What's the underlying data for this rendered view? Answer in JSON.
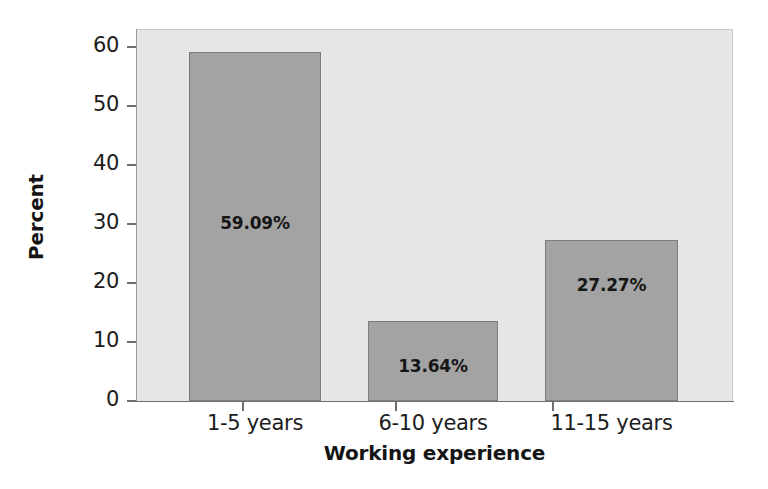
{
  "chart_data": {
    "type": "bar",
    "title": "",
    "xlabel": "Working experience",
    "ylabel": "Percent",
    "categories": [
      "1-5 years",
      "6-10 years",
      "11-15 years"
    ],
    "values": [
      59.09,
      13.64,
      27.27
    ],
    "data_labels": [
      "59.09%",
      "13.64%",
      "27.27%"
    ],
    "ylim": [
      0,
      62
    ],
    "yticks": [
      0,
      10,
      20,
      30,
      40,
      50,
      60
    ],
    "ytick_labels": [
      "0",
      "10",
      "20",
      "30",
      "40",
      "50",
      "60"
    ],
    "grid": false,
    "legend": false,
    "bar_color": "#a3a3a3",
    "bar_edge_color": "#7d7d7d",
    "plot_background": "#e9e9e9",
    "figure_background": "#ffffff",
    "text_color": "#1c1c1c"
  }
}
